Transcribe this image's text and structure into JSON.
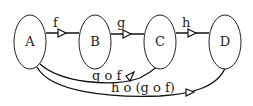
{
  "diagram": {
    "type": "function-composition",
    "nodes": [
      {
        "id": "A",
        "label": "A"
      },
      {
        "id": "B",
        "label": "B"
      },
      {
        "id": "C",
        "label": "C"
      },
      {
        "id": "D",
        "label": "D"
      }
    ],
    "edges": [
      {
        "from": "A",
        "to": "B",
        "label": "f"
      },
      {
        "from": "B",
        "to": "C",
        "label": "g"
      },
      {
        "from": "C",
        "to": "D",
        "label": "h"
      },
      {
        "from": "A",
        "to": "C",
        "label": "g o f"
      },
      {
        "from": "A",
        "to": "D",
        "label": "h o (g o f)"
      }
    ]
  }
}
